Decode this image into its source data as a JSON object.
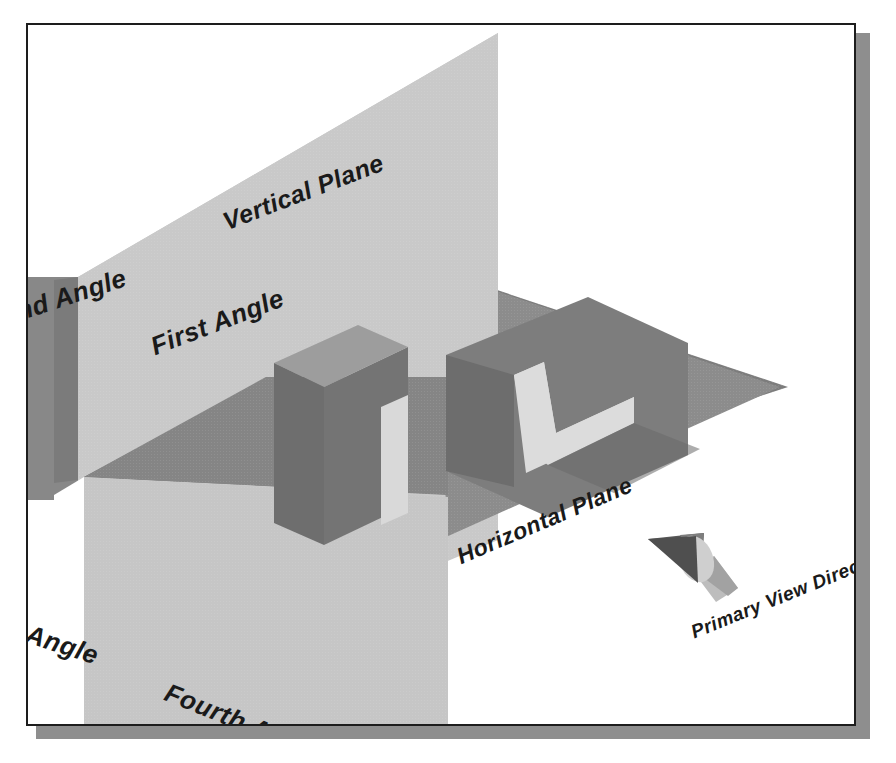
{
  "figure": {
    "kind": "technical-illustration",
    "background_color": "#ffffff",
    "frame": {
      "border_color": "#1d1d1d",
      "shadow_color": "#8e8e8e"
    }
  },
  "labels": {
    "vertical_plane": "Vertical Plane",
    "horizontal_plane": "Horizontal Plane",
    "first_angle": "First Angle",
    "second_angle": "Second Angle",
    "third_angle": "Third Angle",
    "fourth_angle": "Fourth Angle",
    "primary_view_direction": "Primary View Direction"
  },
  "colors": {
    "vertical_plane_face": "#c9c9c9",
    "vertical_plane_face_shaded": "#9a9a9a",
    "horizontal_plane_near": "#8d8d8d",
    "horizontal_plane_far": "#7a7a7a",
    "object_top": "#dcdcdc",
    "object_side_light": "#b4b4b4",
    "object_side_dark": "#6f6f6f",
    "projection_block": "#6b6b6b",
    "arrow_cone": "#5a5a5a",
    "arrow_shaft": "#b9b9b9",
    "text": "#1a1a1a"
  },
  "icons": {
    "view_direction_arrow": "cone-arrow-icon"
  }
}
